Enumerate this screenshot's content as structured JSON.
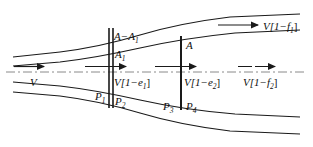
{
  "figure": {
    "type": "streamtube-flow-diagram",
    "colors": {
      "stroke": "#1a1a1a",
      "centerline": "#8a8a8a",
      "background": "#ffffff"
    }
  },
  "labels": {
    "area_annulus": "A−A",
    "area_annulus_sub": "1",
    "area_inner": "A",
    "area_inner_sub": "1",
    "area_total": "A",
    "velocity_inlet": "V",
    "velocity_e1_pre": "V[1−e",
    "velocity_e1_sub": "1",
    "velocity_e1_post": "]",
    "velocity_e2_pre": "V[1−e",
    "velocity_e2_sub": "2",
    "velocity_e2_post": "]",
    "velocity_f1_pre": "V[1−f",
    "velocity_f1_sub": "1",
    "velocity_f1_post": "]",
    "velocity_f2_pre": "V[1−f",
    "velocity_f2_sub": "2",
    "velocity_f2_post": "]",
    "pressure_1": "P",
    "pressure_1_sub": "1",
    "pressure_2": "P",
    "pressure_2_sub": "2",
    "pressure_3": "P",
    "pressure_3_sub": "3",
    "pressure_4": "P",
    "pressure_4_sub": "4"
  },
  "geometry": {
    "station_1_x": 109,
    "station_2_x": 113,
    "station_3_x": 181,
    "centerline_y": 72
  }
}
